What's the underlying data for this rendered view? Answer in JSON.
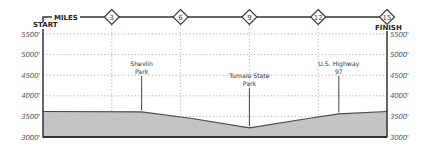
{
  "chart_data": {
    "type": "area",
    "title": "",
    "xlabel": "MILES",
    "ylabel": "",
    "start_label": "START",
    "finish_label": "FINISH",
    "x_ticks": [
      3,
      6,
      9,
      12,
      15
    ],
    "y_ticks": [
      "3000'",
      "3500'",
      "4000'",
      "4500'",
      "5000'",
      "5500'"
    ],
    "y_tick_values": [
      3000,
      3500,
      4000,
      4500,
      5000,
      5500
    ],
    "xlim": [
      0,
      15
    ],
    "ylim": [
      3000,
      5500
    ],
    "grid": true,
    "series": [
      {
        "name": "Elevation",
        "x": [
          0,
          4.3,
          6.5,
          9,
          11.7,
          12.9,
          15
        ],
        "values": [
          3620,
          3610,
          3450,
          3220,
          3460,
          3560,
          3620
        ]
      }
    ],
    "annotations": [
      {
        "label_lines": [
          "Shevlin",
          "Park"
        ],
        "mile": 4.3
      },
      {
        "label_lines": [
          "Tumalo State",
          "Park"
        ],
        "mile": 9.0
      },
      {
        "label_lines": [
          "U.S. Highway",
          "97"
        ],
        "mile": 12.9
      }
    ],
    "colors": {
      "fill": "#c4c4c4",
      "line": "#4a4a4a",
      "axis": "#333333",
      "grid": "#9a9a9a"
    }
  }
}
